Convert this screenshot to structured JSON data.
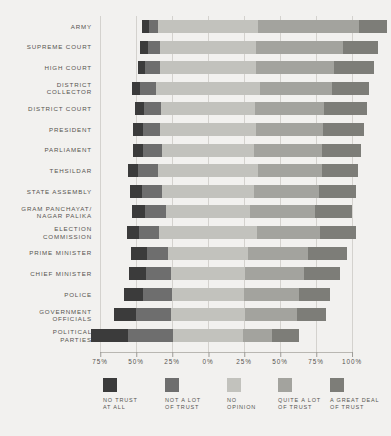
{
  "chart_data": {
    "type": "bar",
    "subtype": "diverging-stacked-bar",
    "title": "",
    "xlabel": "",
    "ylabel": "",
    "grid": true,
    "legend_position": "bottom",
    "axis": {
      "tick_labels": [
        "75%",
        "50%",
        "25%",
        "0%",
        "25%",
        "50%",
        "75%",
        "100%"
      ],
      "tick_values": [
        -75,
        -50,
        -25,
        0,
        25,
        50,
        75,
        100
      ],
      "xlim": [
        -75,
        100
      ],
      "unit": "%"
    },
    "series": [
      {
        "name": "NO TRUST AT ALL",
        "color": "#3b3b3b"
      },
      {
        "name": "NOT A LOT OF TRUST",
        "color": "#6e6e6e"
      },
      {
        "name": "NO OPINION",
        "color": "#c2c2bd"
      },
      {
        "name": "QUITE A LOT OF TRUST",
        "color": "#a3a39e"
      },
      {
        "name": "A GREAT DEAL OF TRUST",
        "color": "#7d7d78"
      }
    ],
    "categories": [
      "ARMY",
      "SUPREME COURT",
      "HIGH COURT",
      "DISTRICT\nCOLLECTOR",
      "DISTRICT COURT",
      "PRESIDENT",
      "PARLIAMENT",
      "TEHSILDAR",
      "STATE ASSEMBLY",
      "GRAM PANCHAYAT/\nNAGAR PALIKA",
      "ELECTION\nCOMMISSION",
      "PRIME MINISTER",
      "CHIEF MINISTER",
      "POLICE",
      "GOVERNMENT\nOFFICIALS",
      "POLITICAL\nPARTIES"
    ],
    "rows": [
      {
        "category": "ARMY",
        "no_trust_at_all": 5,
        "not_a_lot_of_trust": 6,
        "no_opinion": 70,
        "quite_a_lot_of_trust": 70,
        "a_great_deal_of_trust": 19
      },
      {
        "category": "SUPREME COURT",
        "no_trust_at_all": 5,
        "not_a_lot_of_trust": 9,
        "no_opinion": 66,
        "quite_a_lot_of_trust": 61,
        "a_great_deal_of_trust": 24
      },
      {
        "category": "HIGH COURT",
        "no_trust_at_all": 5,
        "not_a_lot_of_trust": 10,
        "no_opinion": 67,
        "quite_a_lot_of_trust": 54,
        "a_great_deal_of_trust": 28
      },
      {
        "category": "DISTRICT COLLECTOR",
        "no_trust_at_all": 6,
        "not_a_lot_of_trust": 11,
        "no_opinion": 72,
        "quite_a_lot_of_trust": 50,
        "a_great_deal_of_trust": 26
      },
      {
        "category": "DISTRICT COURT",
        "no_trust_at_all": 6,
        "not_a_lot_of_trust": 12,
        "no_opinion": 65,
        "quite_a_lot_of_trust": 48,
        "a_great_deal_of_trust": 30
      },
      {
        "category": "PRESIDENT",
        "no_trust_at_all": 7,
        "not_a_lot_of_trust": 12,
        "no_opinion": 66,
        "quite_a_lot_of_trust": 47,
        "a_great_deal_of_trust": 28
      },
      {
        "category": "PARLIAMENT",
        "no_trust_at_all": 7,
        "not_a_lot_of_trust": 13,
        "no_opinion": 64,
        "quite_a_lot_of_trust": 47,
        "a_great_deal_of_trust": 27
      },
      {
        "category": "TEHSILDAR",
        "no_trust_at_all": 7,
        "not_a_lot_of_trust": 14,
        "no_opinion": 69,
        "quite_a_lot_of_trust": 45,
        "a_great_deal_of_trust": 25
      },
      {
        "category": "STATE ASSEMBLY",
        "no_trust_at_all": 8,
        "not_a_lot_of_trust": 14,
        "no_opinion": 64,
        "quite_a_lot_of_trust": 45,
        "a_great_deal_of_trust": 26
      },
      {
        "category": "GRAM PANCHAYAT/ NAGAR PALIKA",
        "no_trust_at_all": 9,
        "not_a_lot_of_trust": 15,
        "no_opinion": 58,
        "quite_a_lot_of_trust": 45,
        "a_great_deal_of_trust": 26
      },
      {
        "category": "ELECTION COMMISSION",
        "no_trust_at_all": 8,
        "not_a_lot_of_trust": 14,
        "no_opinion": 68,
        "quite_a_lot_of_trust": 44,
        "a_great_deal_of_trust": 25
      },
      {
        "category": "PRIME MINISTER",
        "no_trust_at_all": 11,
        "not_a_lot_of_trust": 15,
        "no_opinion": 55,
        "quite_a_lot_of_trust": 42,
        "a_great_deal_of_trust": 27
      },
      {
        "category": "CHIEF MINISTER",
        "no_trust_at_all": 12,
        "not_a_lot_of_trust": 17,
        "no_opinion": 52,
        "quite_a_lot_of_trust": 41,
        "a_great_deal_of_trust": 25
      },
      {
        "category": "POLICE",
        "no_trust_at_all": 13,
        "not_a_lot_of_trust": 20,
        "no_opinion": 50,
        "quite_a_lot_of_trust": 38,
        "a_great_deal_of_trust": 22
      },
      {
        "category": "GOVERNMENT OFFICIALS",
        "no_trust_at_all": 15,
        "not_a_lot_of_trust": 24,
        "no_opinion": 52,
        "quite_a_lot_of_trust": 36,
        "a_great_deal_of_trust": 20
      },
      {
        "category": "POLITICAL PARTIES",
        "no_trust_at_all": 26,
        "not_a_lot_of_trust": 31,
        "no_opinion": 49,
        "quite_a_lot_of_trust": 20,
        "a_great_deal_of_trust": 19
      }
    ]
  },
  "legend": {
    "items": [
      {
        "label": "NO TRUST\nAT ALL",
        "color": "#3b3b3b"
      },
      {
        "label": "NOT A LOT\nOF TRUST",
        "color": "#6e6e6e"
      },
      {
        "label": "NO\nOPINION",
        "color": "#c2c2bd"
      },
      {
        "label": "QUITE A LOT\nOF TRUST",
        "color": "#a3a39e"
      },
      {
        "label": "A GREAT DEAL\nOF TRUST",
        "color": "#7d7d78"
      }
    ]
  },
  "colors": {
    "background": "#f2f1ef",
    "grid": "#d4d2ce",
    "axis": "#b9b7b2",
    "text": "#56544f"
  }
}
